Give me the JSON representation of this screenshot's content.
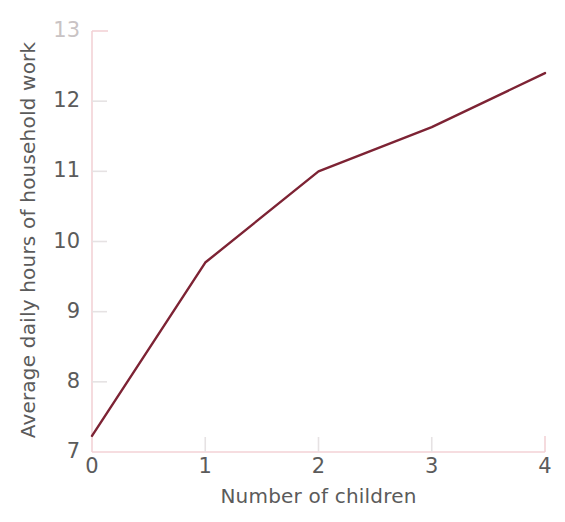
{
  "chart_data": {
    "type": "line",
    "title": "",
    "xlabel": "Number of children",
    "ylabel": "Average daily hours of household work",
    "x": [
      0,
      1,
      2,
      3,
      4
    ],
    "values": [
      7.23,
      9.7,
      11.0,
      11.63,
      12.4
    ],
    "series": [
      {
        "name": "Average daily hours of household work",
        "values": [
          7.23,
          9.7,
          11.0,
          11.63,
          12.4
        ],
        "color": "#7d2334"
      }
    ],
    "xlim": [
      0,
      4
    ],
    "ylim": [
      7,
      13
    ],
    "xticks": [
      0,
      1,
      2,
      3,
      4
    ],
    "xtick_labels": [
      "0",
      "1",
      "2",
      "3",
      "4"
    ],
    "yticks": [
      7,
      8,
      9,
      10,
      11,
      12,
      13
    ],
    "ytick_labels": [
      "7",
      "8",
      "9",
      "10",
      "11",
      "12",
      "13"
    ],
    "grid": false,
    "legend": "none",
    "axis_color": "#f3d2d6",
    "tick_color": "#e6e2e3",
    "text_color": "#5b5b5b",
    "background": "#ffffff"
  }
}
